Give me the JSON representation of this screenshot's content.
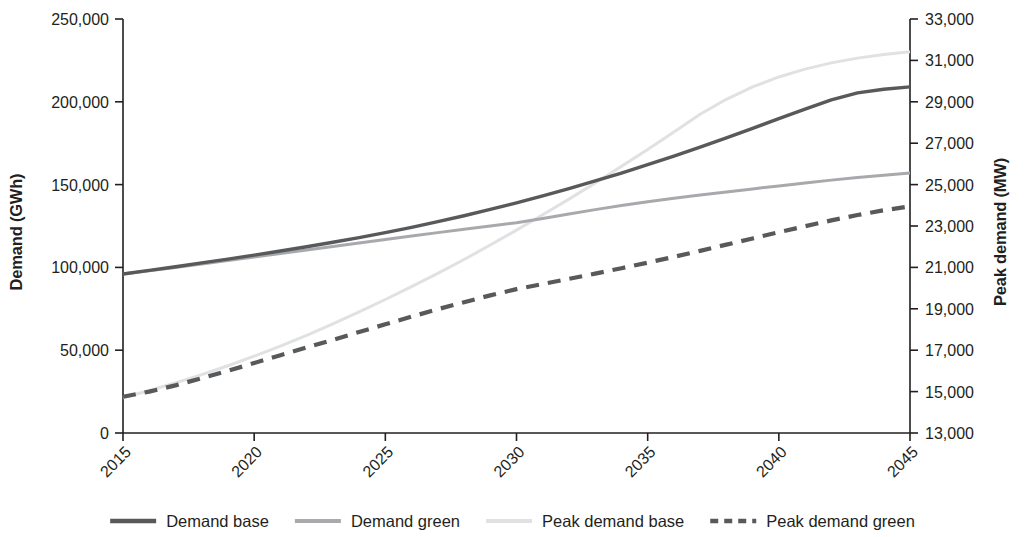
{
  "chart_data": {
    "type": "line",
    "title": "",
    "xlabel": "",
    "ylabel": "Demand (GWh)",
    "y2label": "Peak demand (MW)",
    "x": [
      2015,
      2016,
      2017,
      2018,
      2019,
      2020,
      2021,
      2022,
      2023,
      2024,
      2025,
      2026,
      2027,
      2028,
      2029,
      2030,
      2031,
      2032,
      2033,
      2034,
      2035,
      2036,
      2037,
      2038,
      2039,
      2040,
      2041,
      2042,
      2043,
      2044,
      2045
    ],
    "xticklabels": [
      "2015",
      "2020",
      "2025",
      "2030",
      "2035",
      "2040",
      "2045"
    ],
    "xticks": [
      2015,
      2020,
      2025,
      2030,
      2035,
      2040,
      2045
    ],
    "xlim": [
      2015,
      2045
    ],
    "ylim": [
      0,
      250000
    ],
    "yticks": [
      0,
      50000,
      100000,
      150000,
      200000,
      250000
    ],
    "yticklabels": [
      "0",
      "50,000",
      "100,000",
      "150,000",
      "200,000",
      "250,000"
    ],
    "y2lim": [
      13000,
      33000
    ],
    "y2ticks": [
      13000,
      15000,
      17000,
      19000,
      21000,
      23000,
      25000,
      27000,
      29000,
      31000,
      33000
    ],
    "y2ticklabels": [
      "13,000",
      "15,000",
      "17,000",
      "19,000",
      "21,000",
      "23,000",
      "25,000",
      "27,000",
      "29,000",
      "31,000",
      "33,000"
    ],
    "grid": false,
    "legend_position": "bottom",
    "series": [
      {
        "name": "Demand base",
        "axis": "left",
        "color": "#58595b",
        "width": 3.4,
        "dash": "none",
        "values": [
          96000,
          98200,
          100400,
          102700,
          105000,
          107400,
          109900,
          112500,
          115200,
          118000,
          121000,
          124200,
          127600,
          131200,
          135000,
          139000,
          143200,
          147600,
          152200,
          157000,
          162000,
          167200,
          172600,
          178200,
          184000,
          189800,
          195600,
          201200,
          205400,
          207600,
          209000
        ]
      },
      {
        "name": "Demand green",
        "axis": "left",
        "color": "#a7a9ac",
        "width": 3.0,
        "dash": "none",
        "values": [
          96000,
          98000,
          100000,
          102100,
          104200,
          106300,
          108400,
          110500,
          112600,
          114700,
          116800,
          118900,
          121000,
          123000,
          125000,
          127000,
          129500,
          132200,
          134900,
          137400,
          139700,
          141800,
          143700,
          145600,
          147400,
          149200,
          151000,
          152700,
          154300,
          155700,
          157000
        ]
      },
      {
        "name": "Peak demand base",
        "axis": "right",
        "color": "#e0e1e2",
        "width": 3.0,
        "dash": "none",
        "values": [
          14700,
          15050,
          15420,
          15820,
          16250,
          16710,
          17200,
          17720,
          18270,
          18850,
          19450,
          20070,
          20710,
          21380,
          22080,
          22800,
          23540,
          24300,
          25080,
          25880,
          26700,
          27540,
          28400,
          29120,
          29720,
          30200,
          30580,
          30880,
          31110,
          31290,
          31420
        ]
      },
      {
        "name": "Peak demand green",
        "axis": "right",
        "color": "#58595b",
        "width": 4.2,
        "dash": "13 9",
        "values": [
          14750,
          15000,
          15300,
          15650,
          16000,
          16380,
          16760,
          17130,
          17500,
          17880,
          18250,
          18620,
          18980,
          19320,
          19650,
          19950,
          20200,
          20450,
          20700,
          20960,
          21230,
          21510,
          21800,
          22100,
          22400,
          22700,
          22990,
          23270,
          23530,
          23760,
          23950
        ]
      }
    ]
  },
  "legend": {
    "items": [
      {
        "label": "Demand base",
        "color": "#58595b",
        "dash": "none",
        "width": 4.6
      },
      {
        "label": "Demand green",
        "color": "#a7a9ac",
        "dash": "none",
        "width": 4.2
      },
      {
        "label": "Peak demand base",
        "color": "#e0e1e2",
        "dash": "none",
        "width": 4.0
      },
      {
        "label": "Peak demand green",
        "color": "#58595b",
        "dash": "8 6",
        "width": 4.6
      }
    ]
  }
}
